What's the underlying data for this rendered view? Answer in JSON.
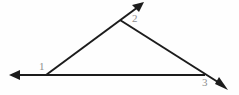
{
  "diagram": {
    "background_color": "#fefefe",
    "stroke_color": "#1c1c1c",
    "label_color": "#8e8e8e",
    "stroke_width": 2,
    "labels": [
      {
        "id": "1",
        "text": "1",
        "x": 42,
        "y": 67
      },
      {
        "id": "2",
        "text": "2",
        "x": 136,
        "y": 19
      },
      {
        "id": "3",
        "text": "3",
        "x": 206,
        "y": 83
      }
    ],
    "vertices": [
      {
        "name": "vertex-1",
        "x": 46,
        "y": 75
      },
      {
        "name": "vertex-2",
        "x": 120,
        "y": 20
      },
      {
        "name": "vertex-3",
        "x": 205,
        "y": 75
      }
    ],
    "rays": [
      {
        "name": "ray-left",
        "from_x": 46,
        "from_y": 75,
        "to_x": 11,
        "to_y": 75,
        "arrowhead": "end"
      },
      {
        "name": "ray-base",
        "from_x": 46,
        "from_y": 75,
        "to_x": 205,
        "to_y": 75,
        "arrowhead": "none"
      },
      {
        "name": "ray-upper",
        "from_x": 46,
        "from_y": 75,
        "to_x": 143,
        "to_y": 3,
        "arrowhead": "end"
      },
      {
        "name": "ray-descending",
        "from_x": 120,
        "from_y": 20,
        "to_x": 227,
        "to_y": 89,
        "arrowhead": "end"
      }
    ]
  }
}
